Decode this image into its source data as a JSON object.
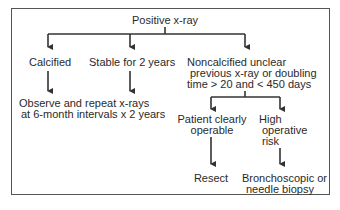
{
  "diagram": {
    "root": "Positive x-ray",
    "branches": {
      "calcified": "Calcified",
      "stable": "Stable for 2 years",
      "noncalcified": [
        "Noncalcified unclear",
        "previous x-ray or doubling",
        "time > 20 and < 450 days"
      ]
    },
    "observe": [
      "Observe and repeat x-rays",
      "at 6-month intervals x 2 years"
    ],
    "operable": [
      "Patient clearly",
      "operable"
    ],
    "high_risk": [
      "High",
      "operative",
      "risk"
    ],
    "resect": "Resect",
    "biopsy": [
      "Bronchoscopic or",
      "needle biopsy"
    ]
  }
}
